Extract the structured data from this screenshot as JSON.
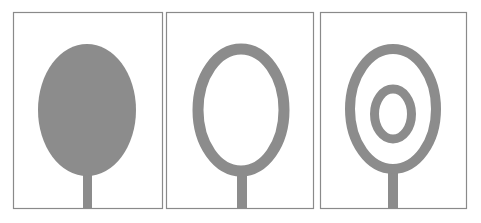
{
  "figure": {
    "colors": {
      "background": "#ffffff",
      "frame": "#8a8a8a",
      "metal": "#8c8c8c"
    },
    "panels": [
      {
        "name": "solid-ellipse-patch",
        "type": "filled-ellipse"
      },
      {
        "name": "single-ring-patch",
        "type": "ring"
      },
      {
        "name": "double-ring-patch",
        "type": "double-ring"
      }
    ]
  }
}
